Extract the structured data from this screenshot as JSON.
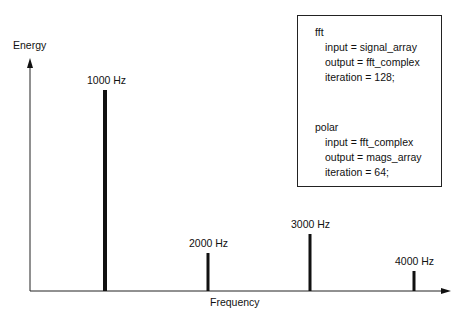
{
  "chart_data": {
    "type": "bar",
    "title": "",
    "xlabel": "Frequency",
    "ylabel": "Energy",
    "categories": [
      "1000 Hz",
      "2000 Hz",
      "3000 Hz",
      "4000 Hz"
    ],
    "values": [
      100,
      19,
      28,
      9
    ],
    "grid": false,
    "legend": null
  },
  "axes": {
    "x_label": "Frequency",
    "y_label": "Energy"
  },
  "peaks": [
    {
      "label": "1000 Hz",
      "x": 105,
      "top": 90,
      "width": 4
    },
    {
      "label": "2000 Hz",
      "x": 208,
      "top": 253,
      "width": 3
    },
    {
      "label": "3000 Hz",
      "x": 310,
      "top": 234,
      "width": 3
    },
    {
      "label": "4000 Hz",
      "x": 414,
      "top": 271,
      "width": 3
    }
  ],
  "code_box": {
    "blocks": [
      {
        "name": "fft",
        "lines": [
          "input = signal_array",
          "output = fft_complex",
          "iteration = 128;"
        ]
      },
      {
        "name": "polar",
        "lines": [
          "input = fft_complex",
          "output = mags_array",
          "iteration = 64;"
        ]
      }
    ]
  }
}
